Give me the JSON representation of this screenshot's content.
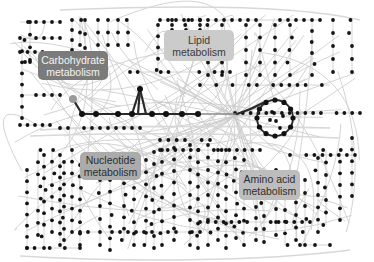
{
  "diagram": {
    "type": "network",
    "colors": {
      "background": "#ffffff",
      "edge": "#c9c9c9",
      "node": "#141414",
      "highlight_path": "#2a2a2a",
      "start_node": "#9a9a9a"
    }
  },
  "labels": [
    {
      "id": "carbohydrate",
      "line1": "Carbohydrate",
      "line2": "metabolism",
      "x": 38,
      "y": 51,
      "w": 70,
      "h": 29,
      "bg": "#7b7b7b",
      "fg": "#f4f4f4"
    },
    {
      "id": "lipid",
      "line1": "Lipid",
      "line2": "metabolism",
      "x": 164,
      "y": 30,
      "w": 70,
      "h": 31,
      "bg": "#cbcbcb",
      "fg": "#3a3a3a"
    },
    {
      "id": "nucleotide",
      "line1": "Nucleotide",
      "line2": "metabolism",
      "x": 80,
      "y": 152,
      "w": 61,
      "h": 28,
      "bg": "#ababab",
      "fg": "#2e2e2e"
    },
    {
      "id": "amino-acid",
      "line1": "Amino acid",
      "line2": "metabolism",
      "x": 239,
      "y": 170,
      "w": 61,
      "h": 30,
      "bg": "#bdbdbd",
      "fg": "#2e2e2e"
    }
  ],
  "highlighted_pathway": {
    "start": [
      73,
      99
    ],
    "nodes": [
      [
        82,
        114
      ],
      [
        96,
        114
      ],
      [
        118,
        114
      ],
      [
        132,
        114
      ],
      [
        152,
        114
      ],
      [
        166,
        114
      ],
      [
        182,
        114
      ],
      [
        198,
        114
      ]
    ],
    "branch": [
      [
        132,
        114
      ],
      [
        140,
        89
      ],
      [
        146,
        114
      ]
    ],
    "grey_segment": [
      [
        198,
        114
      ],
      [
        237,
        114
      ]
    ],
    "cycle": {
      "cx": 275,
      "cy": 118,
      "r": 18,
      "nodes": 12
    }
  }
}
